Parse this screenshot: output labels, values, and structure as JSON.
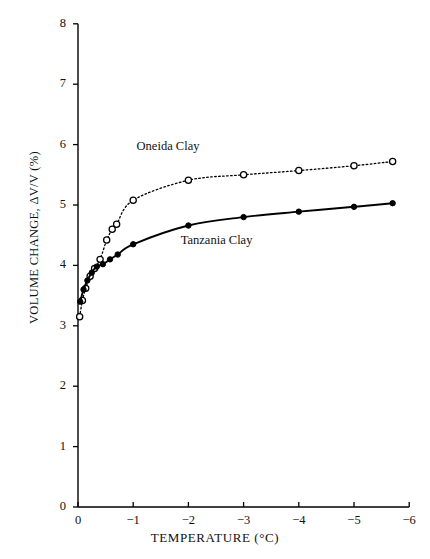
{
  "chart_data": {
    "type": "line",
    "title": "",
    "xlabel": "TEMPERATURE (°C)",
    "ylabel": "VOLUME CHANGE, ΔV/V (%)",
    "xlim": [
      0,
      -6
    ],
    "ylim": [
      0,
      8
    ],
    "xticks": [
      0,
      -1,
      -2,
      -3,
      -4,
      -5,
      -6
    ],
    "xtick_labels": [
      "0",
      "−1",
      "−2",
      "−3",
      "−4",
      "−5",
      "−6"
    ],
    "yticks": [
      0,
      1,
      2,
      3,
      4,
      5,
      6,
      7,
      8
    ],
    "ytick_labels": [
      "0",
      "1",
      "2",
      "3",
      "4",
      "5",
      "6",
      "7",
      "8"
    ],
    "grid": false,
    "legend_position": "inline-annotations",
    "series": [
      {
        "name": "Oneida Clay",
        "marker": "open-circle",
        "linestyle": "dotted",
        "color": "#000000",
        "label_x": -1.75,
        "label_y": 5.95,
        "x": [
          -0.03,
          -0.08,
          -0.14,
          -0.22,
          -0.3,
          -0.4,
          -0.52,
          -0.62,
          -0.7,
          -1.0,
          -2.0,
          -3.0,
          -4.0,
          -5.0,
          -5.7
        ],
        "y": [
          3.15,
          3.42,
          3.62,
          3.82,
          3.95,
          4.1,
          4.42,
          4.6,
          4.68,
          5.08,
          5.41,
          5.5,
          5.57,
          5.65,
          5.72
        ]
      },
      {
        "name": "Tanzania Clay",
        "marker": "filled-circle",
        "linestyle": "solid",
        "color": "#000000",
        "label_x": -2.55,
        "label_y": 4.38,
        "x": [
          -0.04,
          -0.1,
          -0.17,
          -0.25,
          -0.34,
          -0.45,
          -0.58,
          -0.72,
          -1.0,
          -2.0,
          -3.0,
          -4.0,
          -5.0,
          -5.7
        ],
        "y": [
          3.4,
          3.6,
          3.75,
          3.88,
          3.98,
          4.02,
          4.1,
          4.18,
          4.35,
          4.66,
          4.8,
          4.89,
          4.97,
          5.03
        ]
      }
    ]
  },
  "axis": {
    "origin_px": {
      "x": 78,
      "y": 507
    },
    "x_scale_px_per_unit": 55.2,
    "y_scale_px_per_unit": 60.4
  }
}
